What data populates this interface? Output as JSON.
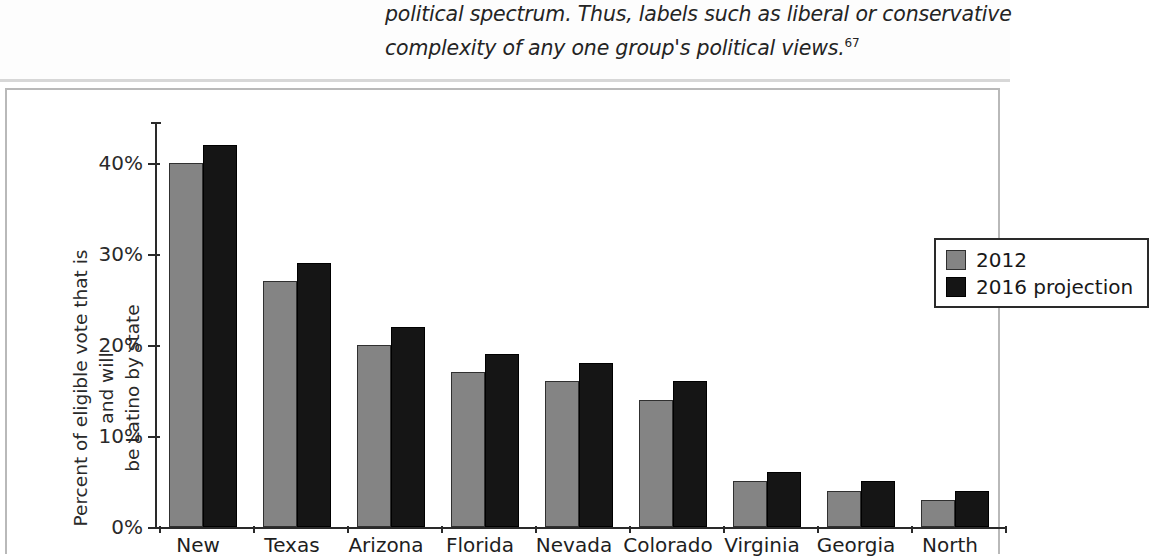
{
  "page_text": {
    "line1": "political spectrum. Thus, labels such as liberal or conservative",
    "line2": "complexity of any one group's political views.",
    "footnote_marker": "67"
  },
  "legend": {
    "items": [
      {
        "label": "2012",
        "color": "#848484"
      },
      {
        "label": "2016 projection",
        "color": "#151515"
      }
    ]
  },
  "chart_data": {
    "type": "bar",
    "title": "",
    "xlabel": "",
    "ylabel": "Percent of eligible vote that is and will be Latino by state",
    "ylabel_line1": "Percent of eligible vote that is and will",
    "ylabel_line2": "be Latino by state",
    "categories": [
      "New",
      "Texas",
      "Arizona",
      "Florida",
      "Nevada",
      "Colorado",
      "Virginia",
      "Georgia",
      "North"
    ],
    "series": [
      {
        "name": "2012",
        "color": "#848484",
        "values": [
          40,
          27,
          20,
          17,
          16,
          14,
          5,
          4,
          3
        ]
      },
      {
        "name": "2016 projection",
        "color": "#151515",
        "values": [
          42,
          29,
          22,
          19,
          18,
          16,
          6,
          5,
          4
        ]
      }
    ],
    "ylim": [
      0,
      45
    ],
    "yticks": [
      0,
      10,
      20,
      30,
      40
    ],
    "ytick_labels": [
      "0%",
      "10%",
      "20%",
      "30%",
      "40%"
    ],
    "grid": false,
    "legend_position": "top-right",
    "value_suffix": "%"
  }
}
